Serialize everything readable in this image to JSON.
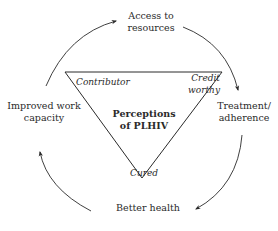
{
  "diagram": {
    "center": {
      "line1": "Perceptions",
      "line2": "of PLHIV"
    },
    "triangle_corners": {
      "top_left": "Contributor",
      "top_right_line1": "Credit",
      "top_right_line2": "worthy",
      "bottom": "Cured"
    },
    "cycle_nodes": {
      "top_line1": "Access to",
      "top_line2": "resources",
      "right_line1": "Treatment/",
      "right_line2": "adherence",
      "bottom": "Better health",
      "left_line1": "Improved work",
      "left_line2": "capacity"
    },
    "cycle_order": [
      "Access to resources",
      "Treatment/adherence",
      "Better health",
      "Improved work capacity"
    ],
    "colors": {
      "line": "#2a2a2a",
      "background": "#ffffff"
    }
  }
}
